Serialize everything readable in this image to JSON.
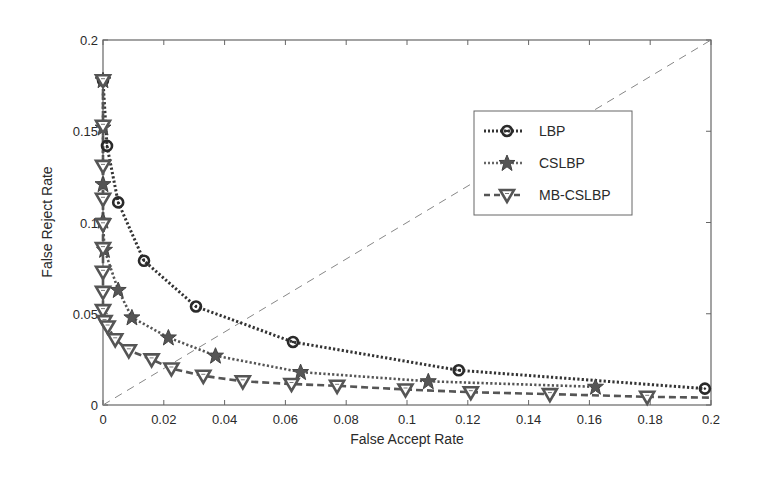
{
  "chart_data": {
    "type": "line",
    "title": "",
    "xlabel": "False Accept Rate",
    "ylabel": "False Reject Rate",
    "xlim": [
      0,
      0.2
    ],
    "ylim": [
      0,
      0.2
    ],
    "grid": false,
    "legend_position": "upper right (inset)",
    "x_ticks": [
      "0",
      "0.02",
      "0.04",
      "0.06",
      "0.08",
      "0.1",
      "0.12",
      "0.14",
      "0.16",
      "0.18",
      "0.2"
    ],
    "y_ticks": [
      "0",
      "0.05",
      "0.1",
      "0.15",
      "0.2"
    ],
    "reference_line": {
      "name": "EER diagonal",
      "x": [
        0,
        0.2
      ],
      "y": [
        0,
        0.2
      ],
      "style": "thin dashed"
    },
    "series": [
      {
        "name": "LBP",
        "marker": "circle",
        "line_style": "dotted",
        "color": "#333333",
        "x": [
          0.0,
          0.0013,
          0.005,
          0.0135,
          0.0306,
          0.0625,
          0.117,
          0.198
        ],
        "y": [
          0.178,
          0.142,
          0.111,
          0.079,
          0.054,
          0.0345,
          0.019,
          0.009
        ]
      },
      {
        "name": "CSLBP",
        "marker": "star",
        "line_style": "dotted",
        "color": "#555555",
        "x": [
          0.0,
          0.0,
          0.0,
          0.0,
          0.0005,
          0.005,
          0.0095,
          0.0215,
          0.037,
          0.065,
          0.107,
          0.162
        ],
        "y": [
          0.178,
          0.152,
          0.121,
          0.101,
          0.085,
          0.063,
          0.048,
          0.037,
          0.027,
          0.018,
          0.013,
          0.01
        ]
      },
      {
        "name": "MB-CSLBP",
        "marker": "triangle-down",
        "line_style": "dashed",
        "color": "#555555",
        "x": [
          0.0,
          0.0,
          0.0,
          0.0,
          0.0,
          0.0,
          0.0,
          0.0,
          0.0,
          0.0005,
          0.0015,
          0.004,
          0.0085,
          0.016,
          0.0225,
          0.033,
          0.046,
          0.062,
          0.077,
          0.0995,
          0.121,
          0.147,
          0.179,
          0.2
        ],
        "y": [
          0.178,
          0.153,
          0.131,
          0.113,
          0.099,
          0.086,
          0.073,
          0.062,
          0.052,
          0.046,
          0.043,
          0.036,
          0.03,
          0.025,
          0.02,
          0.016,
          0.013,
          0.0115,
          0.0105,
          0.0085,
          0.007,
          0.006,
          0.0045,
          0.004
        ]
      }
    ]
  },
  "legend": {
    "items": [
      {
        "label": "LBP"
      },
      {
        "label": "CSLBP"
      },
      {
        "label": "MB-CSLBP"
      }
    ]
  },
  "axes": {
    "xlabel": "False Accept Rate",
    "ylabel": "False Reject Rate"
  }
}
